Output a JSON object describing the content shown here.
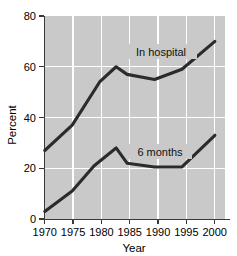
{
  "chart_data": {
    "type": "line",
    "title": "",
    "xlabel": "Year",
    "ylabel": "Percent",
    "xlim": [
      1970,
      2002
    ],
    "ylim": [
      0,
      80
    ],
    "grid": true,
    "legend_position": "inline-annotation",
    "xticks": [
      "1970",
      "1975",
      "1980",
      "1985",
      "1990",
      "1995",
      "2000"
    ],
    "xtick_values": [
      1970,
      1975,
      1980,
      1985,
      1990,
      1995,
      2000
    ],
    "yticks": [
      "0",
      "20",
      "40",
      "60",
      "80"
    ],
    "ytick_values": [
      0,
      20,
      40,
      60,
      80
    ],
    "series": [
      {
        "name": "In hospital",
        "label": "In hospital",
        "color": "#2b2b2b",
        "x": [
          1970,
          1975,
          1980,
          1983,
          1985,
          1990,
          1995,
          2001
        ],
        "values": [
          27,
          37,
          54,
          60,
          57,
          55,
          59,
          70
        ]
      },
      {
        "name": "6 months",
        "label": "6 months",
        "color": "#2b2b2b",
        "x": [
          1970,
          1975,
          1979,
          1983,
          1985,
          1990,
          1995,
          2001
        ],
        "values": [
          3,
          11,
          21,
          28,
          22,
          20.5,
          20.5,
          33
        ]
      }
    ],
    "annotations": [
      {
        "text": "In hospital",
        "x": 1988,
        "y": 65
      },
      {
        "text": "6 months",
        "x": 1988,
        "y": 26
      }
    ],
    "colors": {
      "plot_background": "#c9c9c9",
      "gridline": "#ffffff",
      "line": "#2b2b2b",
      "axis": "#3a3a3a",
      "text": "#000000",
      "figure_background": "#ffffff"
    }
  }
}
